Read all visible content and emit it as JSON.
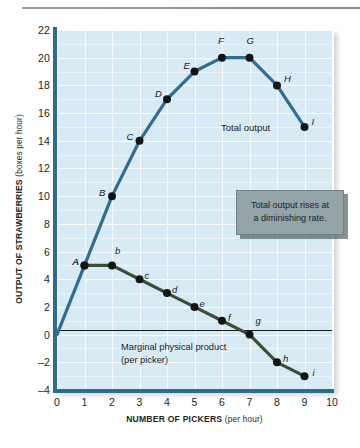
{
  "chart_data": {
    "type": "line",
    "title": "",
    "xlabel": "NUMBER OF PICKERS",
    "xlabel_sub": "(per hour)",
    "ylabel": "OUTPUT OF STRAWBERRIES",
    "ylabel_sub": "(boxes per hour)",
    "xlim": [
      0,
      10
    ],
    "ylim": [
      -4,
      22
    ],
    "xticks": [
      "0",
      "1",
      "2",
      "3",
      "4",
      "5",
      "6",
      "7",
      "8",
      "9",
      "10"
    ],
    "yticks": [
      "22",
      "20",
      "18",
      "16",
      "14",
      "12",
      "10",
      "8",
      "6",
      "4",
      "2",
      "0",
      "-2",
      "-4"
    ],
    "grid": true,
    "legend": "none",
    "zero_line": 0,
    "series": [
      {
        "name": "Total output",
        "color": "#2e6e92",
        "point_label_style": "uppercase-italic",
        "x": [
          0,
          1,
          2,
          3,
          4,
          5,
          6,
          7,
          8,
          9
        ],
        "values": [
          0,
          5,
          10,
          14,
          17,
          19,
          20,
          20,
          18,
          15
        ],
        "point_labels": [
          "",
          "A",
          "B",
          "C",
          "D",
          "E",
          "F",
          "G",
          "H",
          "I"
        ]
      },
      {
        "name": "Marginal physical product",
        "color": "#3f4c35",
        "point_label_style": "lowercase-italic",
        "x": [
          1,
          2,
          3,
          4,
          5,
          6,
          7,
          8,
          9
        ],
        "values": [
          5,
          5,
          4,
          3,
          2,
          1,
          0,
          -2,
          -3
        ],
        "point_labels": [
          "A",
          "b",
          "c",
          "d",
          "e",
          "f",
          "g",
          "h",
          "i"
        ]
      }
    ],
    "annotations": [
      {
        "id": "total-output",
        "text": "Total output"
      },
      {
        "id": "mpp-line1",
        "text": "Marginal physical product"
      },
      {
        "id": "mpp-line2",
        "text": "(per picker)"
      }
    ]
  },
  "callout": {
    "line1": "Total output rises at",
    "line2": "a diminishing rate."
  },
  "colors": {
    "plot_background": "#d8eaf4",
    "axis": "#2b6c8f",
    "total_output": "#2e6e92",
    "marginal_product": "#3f4c35",
    "callout_background": "#93a3a8",
    "zero_line": "#1a1a1a",
    "gridline": "#ffffff"
  }
}
